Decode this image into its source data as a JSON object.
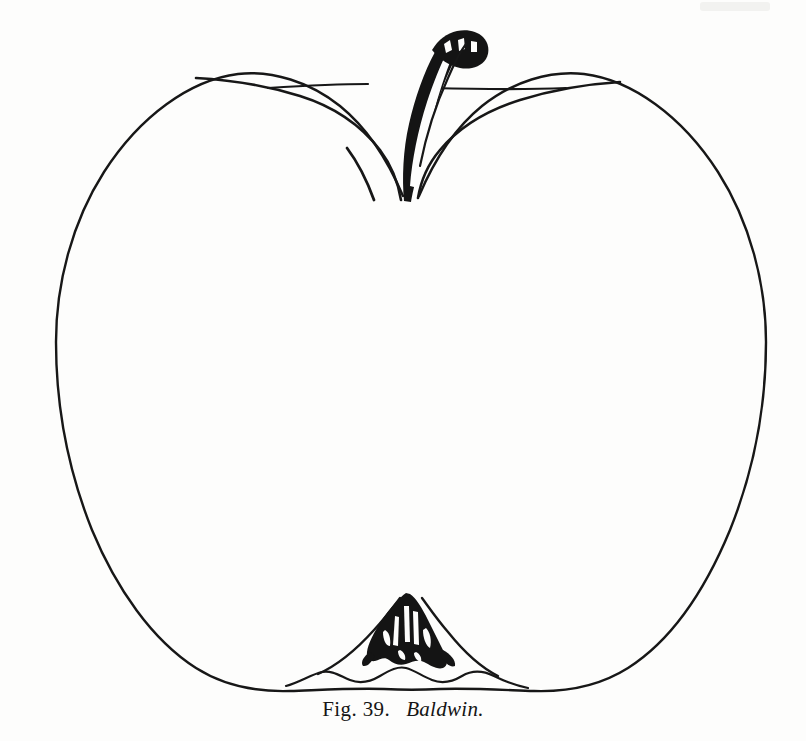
{
  "plate": {
    "background_color": "#fdfdfc",
    "ink_color": "#171717",
    "width": 806,
    "height": 741
  },
  "caption": {
    "figure_label": "Fig. 39.",
    "variety_name": "Baldwin."
  },
  "illustration": {
    "subject": "apple",
    "title": "Baldwin apple, outline engraving",
    "style": "line engraving",
    "parts": [
      {
        "name": "apple-outline",
        "label": "apple body outline"
      },
      {
        "name": "stem",
        "label": "stem"
      },
      {
        "name": "stem-cavity",
        "label": "stem cavity"
      },
      {
        "name": "calyx",
        "label": "calyx with sepals"
      },
      {
        "name": "basin",
        "label": "calyx basin"
      }
    ]
  }
}
